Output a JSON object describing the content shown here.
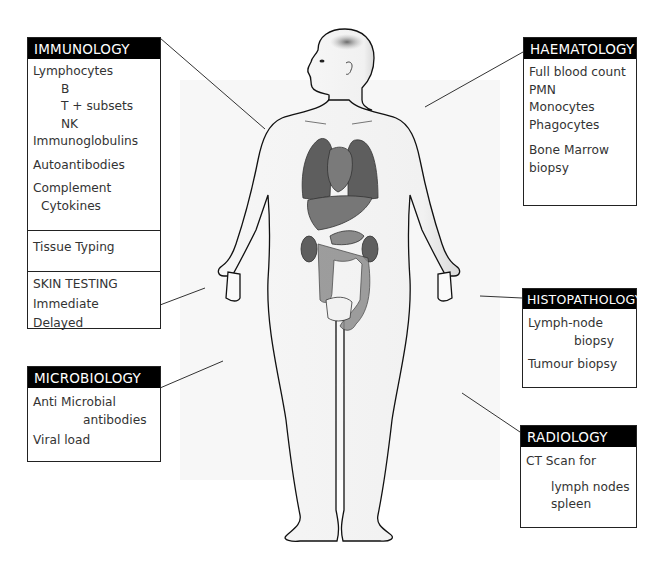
{
  "diagram": {
    "colors": {
      "header_bg": "#000000",
      "header_text": "#ffffff",
      "body_text": "#333333",
      "border": "#222222",
      "organ_gray": "#6e6e6e"
    }
  },
  "panels": {
    "immunology": {
      "title": "IMMUNOLOGY",
      "lines": [
        "Lymphocytes",
        "B",
        "T + subsets",
        "NK",
        "Immunoglobulins",
        "Autoantibodies",
        "Complement",
        "Cytokines"
      ],
      "tissue": "Tissue Typing",
      "skin": [
        "SKIN TESTING",
        "Immediate",
        "Delayed"
      ]
    },
    "microbiology": {
      "title": "MICROBIOLOGY",
      "lines": [
        "Anti Microbial",
        "antibodies",
        "Viral load"
      ]
    },
    "haematology": {
      "title": "HAEMATOLOGY",
      "lines": [
        "Full blood count",
        "PMN",
        "Monocytes",
        "Phagocytes",
        "Bone Marrow",
        "biopsy"
      ]
    },
    "histopathology": {
      "title": "HISTOPATHOLOGY",
      "lines": [
        "Lymph-node",
        "biopsy",
        "Tumour biopsy"
      ]
    },
    "radiology": {
      "title": "RADIOLOGY",
      "lines": [
        "CT Scan for",
        "lymph nodes",
        "spleen"
      ]
    }
  }
}
